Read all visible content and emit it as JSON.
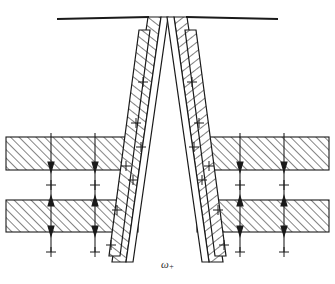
{
  "figure": {
    "kind": "technical-cross-section-diagram",
    "caption_label": "ω",
    "caption_subscript": "+",
    "stroke_color": "#1a1a1a",
    "hatch_color": "#2a2a2a",
    "background_color": "#ffffff",
    "line_width": 1.1
  },
  "layout": {
    "width": 335,
    "height": 284,
    "mirror_axis_x": 167.5
  },
  "top_rails": [
    {
      "name": "left-top-rail",
      "x1": 57,
      "y1": 19,
      "x2": 148,
      "y2": 17
    },
    {
      "name": "right-top-rail",
      "x1": 187,
      "y1": 17,
      "x2": 278,
      "y2": 19
    }
  ],
  "strata": {
    "band_top": {
      "y": 137,
      "height": 33
    },
    "band_bottom": {
      "y": 200,
      "height": 32
    },
    "left_x": 6,
    "left_width": 132,
    "right_x": 197,
    "right_width": 132
  },
  "charge_markers": {
    "glyph": "+",
    "left_columns_x": [
      51,
      95
    ],
    "right_columns_x": [
      240,
      284
    ],
    "rows_y": [
      141,
      166,
      185,
      204,
      229,
      248
    ],
    "slant_left": [
      {
        "x": 131,
        "y": 82
      },
      {
        "x": 136,
        "y": 113
      },
      {
        "x": 129,
        "y": 144
      },
      {
        "x": 123,
        "y": 159
      },
      {
        "x": 118,
        "y": 190
      },
      {
        "x": 112,
        "y": 223
      },
      {
        "x": 142,
        "y": 137
      },
      {
        "x": 140,
        "y": 167
      }
    ],
    "slant_right": [
      {
        "x": 204,
        "y": 82
      },
      {
        "x": 199,
        "y": 113
      },
      {
        "x": 206,
        "y": 144
      },
      {
        "x": 212,
        "y": 159
      },
      {
        "x": 217,
        "y": 190
      },
      {
        "x": 223,
        "y": 223
      },
      {
        "x": 193,
        "y": 137
      },
      {
        "x": 195,
        "y": 167
      }
    ]
  },
  "arrows": {
    "style": "double-headed-vertical",
    "left_columns_x": [
      51,
      95
    ],
    "right_columns_x": [
      240,
      284
    ],
    "segments": [
      {
        "y_top": 146,
        "y_bottom": 176
      },
      {
        "y_top": 196,
        "y_bottom": 212
      },
      {
        "y_top": 212,
        "y_bottom": 238
      }
    ]
  },
  "slanted_columns": {
    "description": "Two pairs of inclined hatched bands converging toward the lower center",
    "left": [
      {
        "name": "left-outer-band",
        "top_x": 148,
        "bottom_x": 112,
        "top_y": 17,
        "bottom_y": 262,
        "thickness": 13
      },
      {
        "name": "left-inner-band",
        "top_x": 157,
        "bottom_x": 124,
        "top_y": 22,
        "bottom_y": 258,
        "thickness": 11
      }
    ],
    "right": [
      {
        "name": "right-outer-band",
        "top_x": 187,
        "bottom_x": 223,
        "top_y": 17,
        "bottom_y": 262,
        "thickness": 13
      },
      {
        "name": "right-inner-band",
        "top_x": 178,
        "bottom_x": 211,
        "top_y": 22,
        "bottom_y": 258,
        "thickness": 11
      }
    ]
  }
}
